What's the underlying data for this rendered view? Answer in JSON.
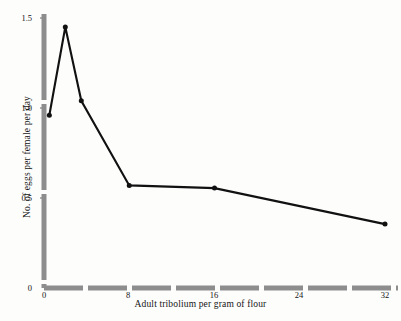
{
  "chart_data": {
    "type": "line",
    "title": "",
    "subtitle": "",
    "xlabel": "Adult tribolium per gram of flour",
    "ylabel": "No. of eggs per female per day",
    "xlim": [
      0,
      34
    ],
    "ylim": [
      0,
      1.5
    ],
    "xticks": [
      0,
      8,
      16,
      24,
      32
    ],
    "xticklabels": [
      "0",
      "8",
      "16",
      "24",
      "32"
    ],
    "yticks": [
      0,
      0.5,
      1.0,
      1.5
    ],
    "yticklabels": [
      "0",
      "0.5",
      "1.0",
      "1.5"
    ],
    "grid": false,
    "legend": false,
    "marker": "filled-circle",
    "series": [
      {
        "name": "eggs per female per day",
        "color": "#111111",
        "x": [
          0.5,
          2,
          3.5,
          8,
          16,
          32
        ],
        "y": [
          0.96,
          1.45,
          1.04,
          0.57,
          0.555,
          0.355
        ]
      }
    ],
    "annotations": []
  },
  "axes": {
    "x_tick_labels": [
      "0",
      "8",
      "16",
      "24",
      "32"
    ],
    "y_tick_labels": [
      "1.5",
      "1.0",
      "0.5",
      "0"
    ],
    "x_title": "Adult tribolium per gram of flour",
    "y_title": "No. of eggs per female per day"
  },
  "style": {
    "axis_color": "#8a8a8a",
    "line_color": "#111111",
    "marker_color": "#111111",
    "background": "#fdfdfc"
  }
}
